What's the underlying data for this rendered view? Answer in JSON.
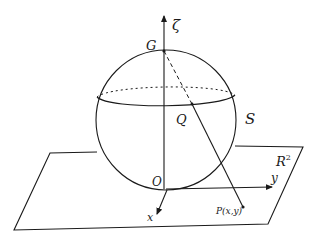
{
  "diagram": {
    "type": "stereographic-projection",
    "labels": {
      "zeta_axis": "ζ",
      "north_pole": "G",
      "sphere_point": "Q",
      "sphere": "S",
      "plane": "R",
      "plane_exponent": "2",
      "origin": "O",
      "x_axis": "x",
      "y_axis": "y",
      "projected_point": "P(x,y)"
    },
    "colors": {
      "stroke": "#1a1a1a",
      "background": "#ffffff"
    }
  }
}
